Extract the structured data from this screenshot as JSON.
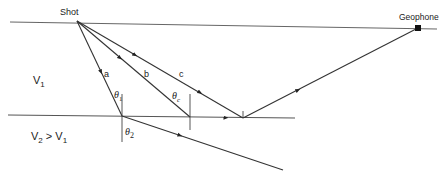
{
  "diagram": {
    "labels": {
      "shot": "Shot",
      "geophone": "Geophone",
      "layer1_velocity": "V",
      "layer1_sub": "1",
      "layer2_velocity_a": "V",
      "layer2_sub_a": "2",
      "layer2_relation": " > ",
      "layer2_velocity_b": "V",
      "layer2_sub_b": "1",
      "ray_a": "a",
      "ray_b": "b",
      "ray_c": "c",
      "theta": "θ",
      "theta1_sub": "1",
      "thetac_sub": "c",
      "theta2_sub": "2"
    },
    "colors": {
      "line": "#333333",
      "surface": "#666666",
      "interface": "#555555",
      "geophone": "#111111"
    },
    "points": {
      "shot": [
        77,
        21
      ],
      "geophone": [
        418,
        28
      ],
      "refract_a": [
        122,
        116
      ],
      "critical": [
        190,
        117
      ],
      "reflect": [
        243,
        118
      ],
      "a_exit": [
        283,
        170
      ]
    }
  }
}
